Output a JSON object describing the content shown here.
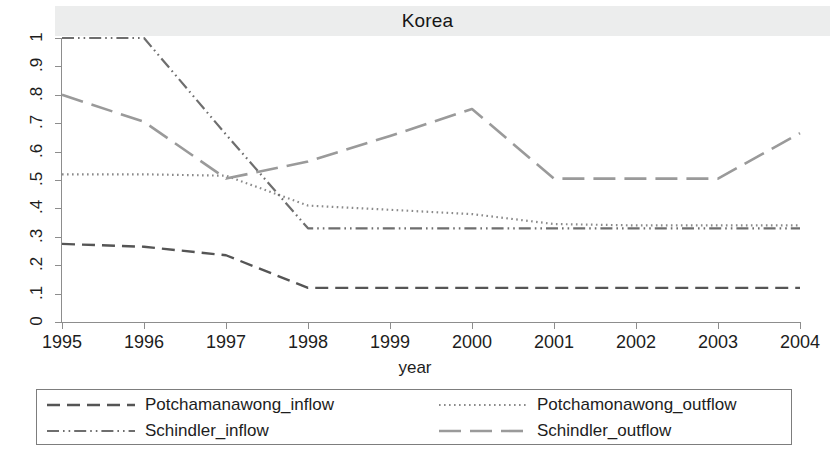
{
  "chart_data": {
    "type": "line",
    "title": "Korea",
    "xlabel": "year",
    "ylabel": "",
    "x": [
      1995,
      1996,
      1997,
      1998,
      1999,
      2000,
      2001,
      2002,
      2003,
      2004
    ],
    "xticklabels": [
      "1995",
      "1996",
      "1997",
      "1998",
      "1999",
      "2000",
      "2001",
      "2002",
      "2003",
      "2004"
    ],
    "yticklabels": [
      "0",
      ".1",
      ".2",
      ".3",
      ".4",
      ".5",
      ".6",
      ".7",
      ".8",
      ".9",
      "1"
    ],
    "ytickvalues": [
      0,
      0.1,
      0.2,
      0.3,
      0.4,
      0.5,
      0.6,
      0.7,
      0.8,
      0.9,
      1
    ],
    "xlim": [
      1995,
      2004
    ],
    "ylim": [
      0,
      1
    ],
    "grid": false,
    "legend_position": "bottom",
    "series": [
      {
        "name": "Potchamanawong_inflow",
        "dash": "dashed",
        "color": "#555555",
        "values": [
          0.275,
          0.265,
          0.235,
          0.12,
          0.12,
          0.12,
          0.12,
          0.12,
          0.12,
          0.12
        ]
      },
      {
        "name": "Potchamonawong_outflow",
        "dash": "dotted",
        "color": "#8a8a8a",
        "values": [
          0.52,
          0.52,
          0.515,
          0.41,
          0.395,
          0.38,
          0.345,
          0.34,
          0.34,
          0.34
        ]
      },
      {
        "name": "Schindler_inflow",
        "dash": "dash-dot-dot",
        "color": "#6e6e6e",
        "values": [
          1.0,
          1.0,
          0.66,
          0.33,
          0.33,
          0.33,
          0.33,
          0.33,
          0.33,
          0.33
        ]
      },
      {
        "name": "Schindler_outflow",
        "dash": "long-dash",
        "color": "#9a9a9a",
        "values": [
          0.8,
          0.705,
          0.505,
          0.565,
          0.655,
          0.75,
          0.505,
          0.505,
          0.505,
          0.665
        ]
      }
    ]
  },
  "legend": {
    "entries": [
      {
        "label": "Potchamanawong_inflow",
        "dash": "dashed"
      },
      {
        "label": "Potchamonawong_outflow",
        "dash": "dotted"
      },
      {
        "label": "Schindler_inflow",
        "dash": "dash-dot-dot"
      },
      {
        "label": "Schindler_outflow",
        "dash": "long-dash"
      }
    ]
  }
}
